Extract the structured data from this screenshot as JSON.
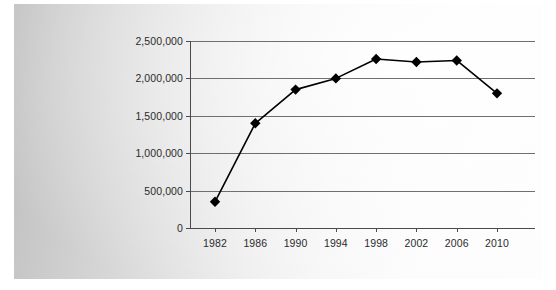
{
  "chart_data": {
    "type": "line",
    "title": "",
    "subtitle": "",
    "xlabel": "",
    "ylabel": "",
    "x": [
      1982,
      1986,
      1990,
      1994,
      1998,
      2002,
      2006,
      2010
    ],
    "categories": [
      "1982",
      "1986",
      "1990",
      "1994",
      "1998",
      "2002",
      "2006",
      "2010"
    ],
    "values": [
      350000,
      1400000,
      1850000,
      2000000,
      2260000,
      2220000,
      2240000,
      1800000
    ],
    "series": [
      {
        "name": "",
        "values": [
          350000,
          1400000,
          1850000,
          2000000,
          2260000,
          2220000,
          2240000,
          1800000
        ]
      }
    ],
    "ylim": [
      0,
      2500000
    ],
    "ytick_values": [
      0,
      500000,
      1000000,
      1500000,
      2000000,
      2500000
    ],
    "ytick_labels": [
      "0",
      "500,000",
      "1,000,000",
      "1,500,000",
      "2,000,000",
      "2,500,000"
    ],
    "xtick_labels": [
      "1982",
      "1986",
      "1990",
      "1994",
      "1998",
      "2002",
      "2006",
      "2010"
    ],
    "grid": "horizontal",
    "legend": "none",
    "marker": "diamond",
    "line_color": "#000000",
    "marker_color": "#000000",
    "grid_color": "#6f6f6f",
    "axis_color": "#4a4a4a",
    "text_color": "#2b2b2b",
    "background_color": "#e4e4e4",
    "annotations": []
  }
}
